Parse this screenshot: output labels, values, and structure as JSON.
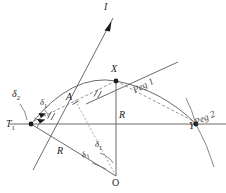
{
  "figure": {
    "type": "engineering-survey-diagram",
    "background_color": "#ffffff",
    "line_color": "#5a5a5a",
    "label_color": "#1c1c1c"
  },
  "points": [
    {
      "id": "T1",
      "label": "T",
      "sub": "1",
      "x": 31,
      "y": 124,
      "role": "tangent-point"
    },
    {
      "id": "X",
      "label": "X",
      "sub": "",
      "x": 116,
      "y": 81,
      "role": "curve-point-peg1"
    },
    {
      "id": "Y",
      "label": "Y",
      "sub": "",
      "x": 196,
      "y": 124,
      "role": "curve-point-peg2"
    },
    {
      "id": "O",
      "label": "O",
      "sub": "",
      "x": 116,
      "y": 176,
      "role": "curve-centre"
    }
  ],
  "labels": {
    "line_I": "I",
    "peg_1": "Peg 1",
    "peg_2": "Peg 2",
    "chord_A": "A",
    "radius_left": "R",
    "radius_vertical": "R",
    "delta_2": "δ",
    "delta_2_sub": "2",
    "delta_1_tangent": "δ",
    "delta_1_tangent_sub": "1",
    "delta_1_centre": "δ",
    "delta_1_centre_sub": "1",
    "delta_1_centre_prime": "δ",
    "delta_1_centre_prime_sub": "1",
    "point_T1": "T",
    "point_T1_sub": "1",
    "point_X": "X",
    "point_Y": "Y",
    "point_O": "O"
  },
  "annotations": {
    "right_angle_marker": "right-angle at T1 between tangent and baseline",
    "chord_ticks": "equal-length tick marks on chord T1-X and chord X-Y",
    "arrowheads": "deflection direction arrows at T1 and along line I"
  }
}
